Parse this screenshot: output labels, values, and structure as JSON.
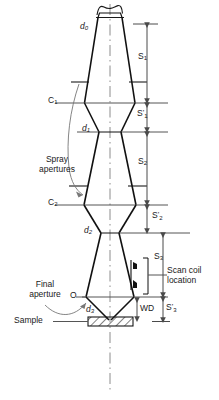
{
  "figure": {
    "type": "ray-diagram",
    "axis_label": "optic-axis"
  },
  "labels": {
    "d0": "d",
    "d0_sub": "0",
    "d1": "d",
    "d1_sub": "1",
    "d2": "d",
    "d2_sub": "2",
    "d3": "d",
    "d3_sub": "3",
    "c1": "C",
    "c1_sub": "1",
    "c2": "C",
    "c2_sub": "2",
    "o": "O",
    "spray_line1": "Spray",
    "spray_line2": "apertures",
    "final_line1": "Final",
    "final_line2": "aperture",
    "sample": "Sample",
    "scan_line1": "Scan coil",
    "scan_line2": "location",
    "wd": "WD"
  },
  "dimensions": [
    {
      "name": "S1",
      "base": "S",
      "sub": "1",
      "prime": "",
      "from_y": 24,
      "to_y": 103,
      "label_y": 57
    },
    {
      "name": "S1p",
      "base": "S",
      "sub": "1",
      "prime": "'",
      "from_y": 103,
      "to_y": 132,
      "label_y": 112
    },
    {
      "name": "S2",
      "base": "S",
      "sub": "2",
      "prime": "",
      "from_y": 132,
      "to_y": 205,
      "label_y": 162
    },
    {
      "name": "S2p",
      "base": "S",
      "sub": "2",
      "prime": "'",
      "from_y": 205,
      "to_y": 233,
      "label_y": 213
    },
    {
      "name": "S3",
      "base": "S",
      "sub": "3",
      "prime": "",
      "from_y": 233,
      "to_y": 297,
      "label_y": 258
    },
    {
      "name": "S3p",
      "base": "S",
      "sub": "3",
      "prime": "'",
      "from_y": 297,
      "to_y": 322,
      "label_y": 303
    },
    {
      "name": "WD",
      "base": "WD",
      "sub": "",
      "prime": "",
      "from_y": 297,
      "to_y": 322,
      "label_y": 305
    }
  ],
  "colors": {
    "ink": "#1a1a1a",
    "beam": "#111111",
    "thin": "#555555",
    "axis": "#888888",
    "scan_coil": "#111111"
  },
  "geometry": {
    "axis_x": 110,
    "source_y": 17,
    "c1_y": 103,
    "d1_y": 132,
    "c2_y": 205,
    "d2_y": 233,
    "o_y": 297,
    "sample_y": 320
  }
}
